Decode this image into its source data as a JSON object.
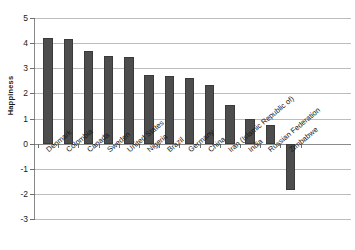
{
  "chart_data": {
    "type": "bar",
    "title": "",
    "xlabel": "",
    "ylabel": "Happiness",
    "ylim": [
      -3,
      5
    ],
    "yticks": [
      5,
      4,
      3,
      2,
      1,
      0,
      -1,
      -2,
      -3
    ],
    "ytick_labels": [
      "5",
      "4",
      "3",
      "2",
      "1",
      "0",
      "-1",
      "-2",
      "-3"
    ],
    "grid": true,
    "legend": "none",
    "categories": [
      "Denmark",
      "Colombia",
      "Canada",
      "Sweden",
      "United States",
      "Nigeria",
      "Brazil",
      "Germany",
      "China",
      "Iran (Islamic Republic of)",
      "India",
      "Russian Federation",
      "Zimbabwe"
    ],
    "values": [
      4.2,
      4.15,
      3.7,
      3.5,
      3.45,
      2.75,
      2.7,
      2.6,
      2.35,
      1.55,
      1.0,
      0.75,
      -1.85
    ],
    "bar_color": "#4d4d4d",
    "gridline_color": "#bdbdbd",
    "axis_color": "#8a8a8a"
  }
}
